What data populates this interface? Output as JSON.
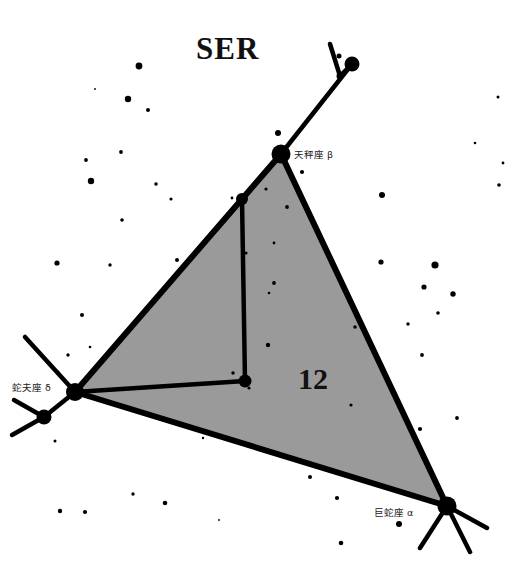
{
  "chart_data": {
    "type": "scatter",
    "title": "SER",
    "subtitle": "",
    "xlabel": "",
    "ylabel": "",
    "grid": false,
    "legend_position": "none",
    "region_number": "12",
    "background_color": "#ffffff",
    "polygon_fill_color": "#9a9a9a",
    "line_color": "#000000",
    "star_color": "#000000",
    "axis_ranges": {
      "x": [
        0,
        513
      ],
      "y": [
        0,
        565
      ]
    },
    "boundary_polygon": [
      [
        281,
        154
      ],
      [
        447,
        506
      ],
      [
        75,
        392
      ]
    ],
    "named_stars": [
      {
        "label": "天秤座 β",
        "x": 281,
        "y": 154,
        "r": 9.5,
        "label_x": 294,
        "label_y": 150
      },
      {
        "label": "蛇夫座 δ",
        "x": 75,
        "y": 392,
        "r": 9.0,
        "label_x": 12,
        "label_y": 383
      },
      {
        "label": "巨蛇座 α",
        "x": 447,
        "y": 506,
        "r": 9.5,
        "label_x": 374,
        "label_y": 508
      }
    ],
    "constellation_line_stars": [
      {
        "x": 281,
        "y": 154,
        "r": 9.5
      },
      {
        "x": 242,
        "y": 199,
        "r": 6.0
      },
      {
        "x": 245,
        "y": 381,
        "r": 6.5
      },
      {
        "x": 75,
        "y": 392,
        "r": 9.0
      },
      {
        "x": 44,
        "y": 417,
        "r": 7.5
      },
      {
        "x": 447,
        "y": 506,
        "r": 9.5
      },
      {
        "x": 352,
        "y": 64,
        "r": 7.5
      },
      {
        "x": 340,
        "y": 76,
        "r": 3.5
      },
      {
        "x": 339,
        "y": 56,
        "r": 2.5
      }
    ],
    "constellation_lines": [
      {
        "from": [
          281,
          154
        ],
        "to": [
          352,
          64
        ]
      },
      {
        "from": [
          352,
          64
        ],
        "to": [
          340,
          76
        ]
      },
      {
        "from": [
          340,
          76
        ],
        "to": [
          330,
          44
        ]
      },
      {
        "from": [
          242,
          199
        ],
        "to": [
          245,
          381
        ]
      },
      {
        "from": [
          245,
          381
        ],
        "to": [
          75,
          392
        ]
      },
      {
        "from": [
          75,
          392
        ],
        "to": [
          25,
          337
        ]
      },
      {
        "from": [
          75,
          392
        ],
        "to": [
          44,
          417
        ]
      },
      {
        "from": [
          44,
          417
        ],
        "to": [
          14,
          400
        ]
      },
      {
        "from": [
          44,
          417
        ],
        "to": [
          12,
          435
        ]
      },
      {
        "from": [
          447,
          506
        ],
        "to": [
          420,
          548
        ]
      },
      {
        "from": [
          447,
          506
        ],
        "to": [
          470,
          552
        ]
      },
      {
        "from": [
          447,
          506
        ],
        "to": [
          487,
          528
        ]
      }
    ],
    "background_stars": [
      {
        "x": 139,
        "y": 66,
        "r": 3.4
      },
      {
        "x": 128,
        "y": 99,
        "r": 3.2
      },
      {
        "x": 148,
        "y": 110,
        "r": 2.0
      },
      {
        "x": 121,
        "y": 152,
        "r": 1.9
      },
      {
        "x": 86,
        "y": 160,
        "r": 1.9
      },
      {
        "x": 91,
        "y": 181,
        "r": 3.2
      },
      {
        "x": 156,
        "y": 184,
        "r": 1.8
      },
      {
        "x": 171,
        "y": 199,
        "r": 1.6
      },
      {
        "x": 122,
        "y": 220,
        "r": 1.8
      },
      {
        "x": 57,
        "y": 263,
        "r": 2.6
      },
      {
        "x": 110,
        "y": 265,
        "r": 1.7
      },
      {
        "x": 82,
        "y": 315,
        "r": 2.0
      },
      {
        "x": 95,
        "y": 89,
        "r": 0.9
      },
      {
        "x": 133,
        "y": 494,
        "r": 1.7
      },
      {
        "x": 60,
        "y": 511,
        "r": 2.2
      },
      {
        "x": 85,
        "y": 512,
        "r": 2.1
      },
      {
        "x": 165,
        "y": 503,
        "r": 2.3
      },
      {
        "x": 203,
        "y": 438,
        "r": 1.2
      },
      {
        "x": 90,
        "y": 347,
        "r": 1.3
      },
      {
        "x": 58,
        "y": 372,
        "r": 1.5
      },
      {
        "x": 68,
        "y": 355,
        "r": 1.7
      },
      {
        "x": 108,
        "y": 403,
        "r": 1.7
      },
      {
        "x": 55,
        "y": 441,
        "r": 1.5
      },
      {
        "x": 278,
        "y": 133,
        "r": 3.0
      },
      {
        "x": 302,
        "y": 172,
        "r": 2.1
      },
      {
        "x": 266,
        "y": 189,
        "r": 1.6
      },
      {
        "x": 287,
        "y": 207,
        "r": 1.9
      },
      {
        "x": 246,
        "y": 253,
        "r": 1.6
      },
      {
        "x": 274,
        "y": 243,
        "r": 1.4
      },
      {
        "x": 274,
        "y": 283,
        "r": 1.9
      },
      {
        "x": 269,
        "y": 293,
        "r": 1.3
      },
      {
        "x": 355,
        "y": 327,
        "r": 1.8
      },
      {
        "x": 268,
        "y": 345,
        "r": 2.2
      },
      {
        "x": 233,
        "y": 373,
        "r": 1.7
      },
      {
        "x": 249,
        "y": 388,
        "r": 1.6
      },
      {
        "x": 232,
        "y": 198,
        "r": 1.4
      },
      {
        "x": 382,
        "y": 195,
        "r": 3.0
      },
      {
        "x": 499,
        "y": 185,
        "r": 1.8
      },
      {
        "x": 381,
        "y": 262,
        "r": 2.6
      },
      {
        "x": 435,
        "y": 265,
        "r": 3.6
      },
      {
        "x": 424,
        "y": 287,
        "r": 2.6
      },
      {
        "x": 453,
        "y": 294,
        "r": 2.7
      },
      {
        "x": 438,
        "y": 313,
        "r": 1.8
      },
      {
        "x": 408,
        "y": 324,
        "r": 1.7
      },
      {
        "x": 422,
        "y": 355,
        "r": 1.9
      },
      {
        "x": 457,
        "y": 418,
        "r": 1.9
      },
      {
        "x": 420,
        "y": 429,
        "r": 2.1
      },
      {
        "x": 351,
        "y": 405,
        "r": 1.6
      },
      {
        "x": 498,
        "y": 97,
        "r": 1.5
      },
      {
        "x": 475,
        "y": 143,
        "r": 1.3
      },
      {
        "x": 503,
        "y": 163,
        "r": 1.4
      },
      {
        "x": 310,
        "y": 477,
        "r": 2.0
      },
      {
        "x": 337,
        "y": 498,
        "r": 2.1
      },
      {
        "x": 399,
        "y": 524,
        "r": 3.0
      },
      {
        "x": 341,
        "y": 543,
        "r": 2.3
      },
      {
        "x": 280,
        "y": 455,
        "r": 1.1
      },
      {
        "x": 219,
        "y": 520,
        "r": 0.9
      },
      {
        "x": 177,
        "y": 260,
        "r": 2.0
      }
    ]
  },
  "labels": {
    "title": "SER",
    "region_number": "12",
    "star_libra_beta": "天秤座 β",
    "star_ophiuchus_delta": "蛇夫座 δ",
    "star_serpens_alpha": "巨蛇座 α"
  }
}
